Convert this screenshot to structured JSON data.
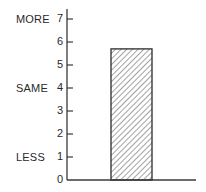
{
  "chart_data": {
    "type": "bar",
    "title": "",
    "xlabel": "",
    "ylabel": "",
    "categories": [
      ""
    ],
    "values": [
      5.7
    ],
    "ylim": [
      0,
      7
    ],
    "yticks": [
      0,
      1,
      2,
      3,
      4,
      5,
      6,
      7
    ],
    "y_category_labels": [
      {
        "value": 7,
        "label": "MORE"
      },
      {
        "value": 4,
        "label": "SAME"
      },
      {
        "value": 1,
        "label": "LESS"
      }
    ],
    "grid": false,
    "legend": null,
    "bar_fill": "diagonal-hatch",
    "colors": {
      "axis": "#3a3a3a",
      "bar_outline": "#2a2a2a",
      "hatch": "#555555",
      "text": "#2a2a2a"
    }
  },
  "labels": {
    "more": "MORE",
    "same": "SAME",
    "less": "LESS",
    "ticks": [
      "0",
      "1",
      "2",
      "3",
      "4",
      "5",
      "6",
      "7"
    ]
  }
}
